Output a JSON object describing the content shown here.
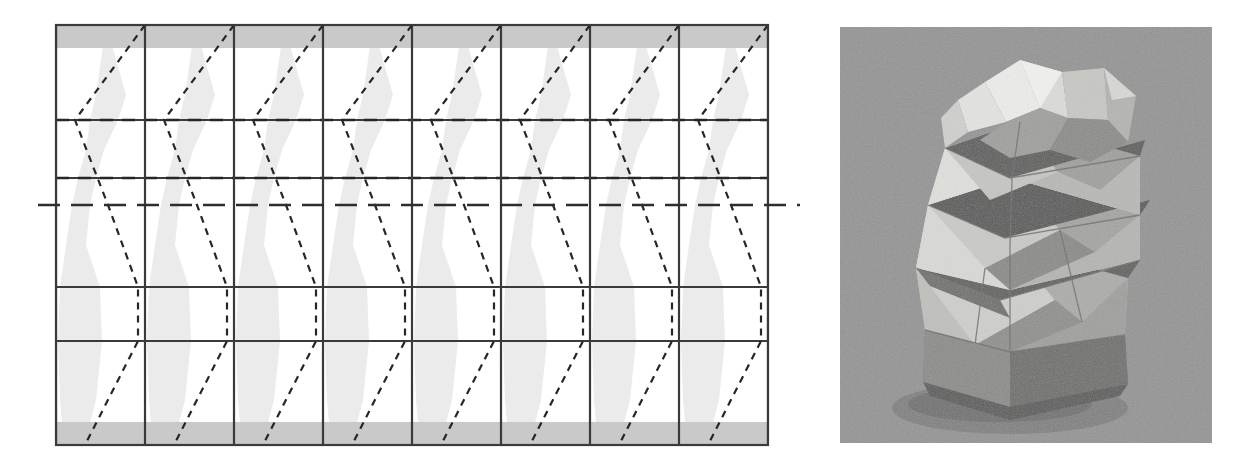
{
  "figure": {
    "type": "origami-crease-pattern-and-model-photo",
    "panels": [
      {
        "name": "crease-pattern-diagram",
        "caption": ""
      },
      {
        "name": "folded-model-photograph",
        "caption": ""
      }
    ]
  },
  "crease_pattern": {
    "name": "twisted-pleated-tower-crease-pattern",
    "bounds": {
      "x": 56,
      "y": 25,
      "width": 712,
      "height": 420
    },
    "columns": 8,
    "column_width": 89,
    "vertical_lines_x": [
      56,
      145,
      234,
      323,
      412,
      501,
      590,
      679,
      768
    ],
    "horizontal_solid_lines_y": [
      120,
      178,
      287,
      341
    ],
    "horizontal_dashdot_lines_y": [
      120,
      178
    ],
    "center_long_dash_line": {
      "y": 205,
      "x_start": 38,
      "x_end": 800
    },
    "border_rect": {
      "x": 56,
      "y": 25,
      "width": 712,
      "height": 420
    },
    "gray_bands": [
      {
        "name": "top-margin-band",
        "y": 25,
        "height": 23,
        "color": "#c9c9c9"
      },
      {
        "name": "bottom-margin-band",
        "y": 422,
        "height": 23,
        "color": "#c9c9c9"
      }
    ],
    "zigzag": {
      "description": "per-column dashed zigzag crease; vertices at column-relative offsets",
      "vertex_offsets_x": [
        45,
        19,
        38,
        38,
        45
      ],
      "vertex_y": [
        25,
        120,
        178,
        205,
        287,
        341,
        445
      ],
      "dash_pattern": "7 6",
      "stroke": "#262626",
      "stroke_width": 2.2
    },
    "shaded_lens": {
      "name": "shaded-facet-region",
      "fill": "#ebebeb",
      "description": "pale gray lens/diamond facets between adjacent zigzag creases"
    },
    "colors": {
      "line": "#262626",
      "solid_grid": "#3a3a3a",
      "shade": "#ebebeb",
      "band": "#c9c9c9",
      "background": "#ffffff"
    }
  },
  "photograph": {
    "name": "folded-origami-tower-photo",
    "subject": "twisted pleated polygonal origami vessel",
    "bounds": {
      "x": 840,
      "y": 27,
      "width": 372,
      "height": 416
    },
    "background_color": "#949494",
    "palette": {
      "highlight": "#e8e8e6",
      "light": "#d2d2cf",
      "mid": "#b3b3b0",
      "midshadow": "#8e8e8c",
      "shadow": "#6d6d6b",
      "deep": "#4f4f4e"
    }
  }
}
